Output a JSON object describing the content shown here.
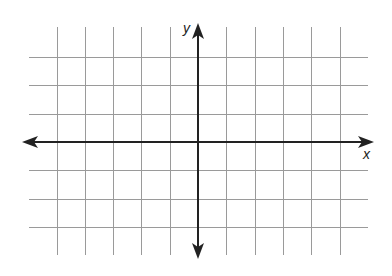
{
  "chart_data": {
    "type": "line",
    "title": "",
    "subtitle": "",
    "xlabel": "x",
    "ylabel": "y",
    "x_grid_lines_left_of_y_axis": 5,
    "x_grid_lines_right_of_y_axis": 5,
    "y_grid_lines_above_x_axis": 3,
    "y_grid_lines_below_x_axis": 3,
    "xlim": [
      -6,
      6
    ],
    "ylim": [
      -4,
      4
    ],
    "grid": true,
    "tick_labels": [],
    "series": [],
    "axes": {
      "x_axis": {
        "arrows": "both",
        "label": "x"
      },
      "y_axis": {
        "arrows": "both",
        "label": "y"
      }
    },
    "legend": null
  },
  "colors": {
    "grid": "#9a9a9a",
    "axis": "#222222",
    "background": "#ffffff"
  },
  "labels": {
    "x_axis": "x",
    "y_axis": "y"
  }
}
